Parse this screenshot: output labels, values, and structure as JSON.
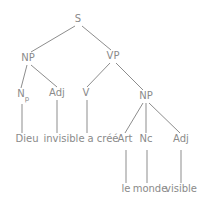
{
  "figure": {
    "name": "syntax-tree-diagram",
    "language": "French",
    "sentence": "Dieu invisible a créé le monde visible",
    "text_color": "#8a8a8a",
    "line_color": "#8d8d8d",
    "background_color": "#ffffff",
    "width": 205,
    "height": 202
  },
  "nodes": [
    {
      "id": "S",
      "label": "S",
      "sub": "",
      "x": 78,
      "y": 22,
      "kind": "phrase"
    },
    {
      "id": "NP1",
      "label": "NP",
      "sub": "",
      "x": 28,
      "y": 61,
      "kind": "phrase"
    },
    {
      "id": "VP",
      "label": "VP",
      "sub": "",
      "x": 113,
      "y": 59,
      "kind": "phrase"
    },
    {
      "id": "Np",
      "label": "N",
      "sub": "p",
      "x": 21,
      "y": 97,
      "kind": "pos"
    },
    {
      "id": "Adj1",
      "label": "Adj",
      "sub": "",
      "x": 57,
      "y": 96,
      "kind": "pos"
    },
    {
      "id": "V",
      "label": "V",
      "sub": "",
      "x": 86,
      "y": 96,
      "kind": "pos"
    },
    {
      "id": "NP2",
      "label": "NP",
      "sub": "",
      "x": 146,
      "y": 99,
      "kind": "phrase"
    },
    {
      "id": "Art",
      "label": "Art",
      "sub": "",
      "x": 125,
      "y": 142,
      "kind": "pos"
    },
    {
      "id": "Nc",
      "label": "Nc",
      "sub": "",
      "x": 146,
      "y": 142,
      "kind": "pos"
    },
    {
      "id": "Adj2",
      "label": "Adj",
      "sub": "",
      "x": 181,
      "y": 142,
      "kind": "pos"
    },
    {
      "id": "w1",
      "label": "Dieu",
      "sub": "",
      "x": 27,
      "y": 142,
      "kind": "word"
    },
    {
      "id": "w2",
      "label": "invisible",
      "sub": "",
      "x": 64,
      "y": 142,
      "kind": "word"
    },
    {
      "id": "w3",
      "label": "a créé",
      "sub": "",
      "x": 103,
      "y": 142,
      "kind": "word"
    },
    {
      "id": "w4",
      "label": "le",
      "sub": "",
      "x": 126,
      "y": 192,
      "kind": "word"
    },
    {
      "id": "w5",
      "label": "monde",
      "sub": "",
      "x": 150,
      "y": 192,
      "kind": "word"
    },
    {
      "id": "w6",
      "label": "visible",
      "sub": "",
      "x": 181,
      "y": 192,
      "kind": "word"
    }
  ],
  "edges": [
    {
      "from": "S",
      "to": "NP1",
      "x1": 75,
      "y1": 26,
      "x2": 31,
      "y2": 52
    },
    {
      "from": "S",
      "to": "VP",
      "x1": 82,
      "y1": 26,
      "x2": 111,
      "y2": 50
    },
    {
      "from": "NP1",
      "to": "Np",
      "x1": 27,
      "y1": 65,
      "x2": 21,
      "y2": 88
    },
    {
      "from": "NP1",
      "to": "Adj1",
      "x1": 31,
      "y1": 65,
      "x2": 57,
      "y2": 87
    },
    {
      "from": "VP",
      "to": "V",
      "x1": 110,
      "y1": 63,
      "x2": 87,
      "y2": 87
    },
    {
      "from": "VP",
      "to": "NP2",
      "x1": 116,
      "y1": 63,
      "x2": 143,
      "y2": 90
    },
    {
      "from": "Np",
      "to": "w1",
      "x1": 22,
      "y1": 104,
      "x2": 22,
      "y2": 133
    },
    {
      "from": "Adj1",
      "to": "w2",
      "x1": 57,
      "y1": 100,
      "x2": 57,
      "y2": 133
    },
    {
      "from": "V",
      "to": "w3",
      "x1": 87,
      "y1": 100,
      "x2": 87,
      "y2": 133
    },
    {
      "from": "NP2",
      "to": "Art",
      "x1": 143,
      "y1": 103,
      "x2": 125,
      "y2": 133
    },
    {
      "from": "NP2",
      "to": "Nc",
      "x1": 146,
      "y1": 103,
      "x2": 146,
      "y2": 133
    },
    {
      "from": "NP2",
      "to": "Adj2",
      "x1": 149,
      "y1": 103,
      "x2": 180,
      "y2": 133
    },
    {
      "from": "Art",
      "to": "w4",
      "x1": 126,
      "y1": 150,
      "x2": 126,
      "y2": 183
    },
    {
      "from": "Nc",
      "to": "w5",
      "x1": 147,
      "y1": 150,
      "x2": 147,
      "y2": 183
    },
    {
      "from": "Adj2",
      "to": "w6",
      "x1": 181,
      "y1": 150,
      "x2": 181,
      "y2": 183
    }
  ]
}
